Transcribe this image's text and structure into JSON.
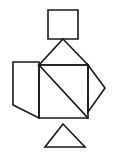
{
  "canvas": {
    "width": 123,
    "height": 153,
    "background_color": "#ffffff",
    "stroke_color": "#1a1a1a",
    "stroke_width": 1.6,
    "fill": "none"
  },
  "figure": {
    "description": "Line-drawing tangram silhouette resembling a bird or rooster, composed of seven outlined polygons: a small square head, a triangular neck, a large square body split by a diagonal, a right-pointing triangle beak-tail, a left parallelogram wing, and a triangular base stand.",
    "piece_count": 7
  },
  "shapes": [
    {
      "id": "head-square",
      "name": "head-square",
      "type": "polygon",
      "points": "48,10 78,10 78,39 48,39"
    },
    {
      "id": "neck-triangle",
      "name": "neck-triangle",
      "type": "polygon",
      "points": "63,39 88,65 39,65"
    },
    {
      "id": "body-square",
      "name": "body-square",
      "type": "polygon",
      "points": "39,65 88,65 88,118 39,118"
    },
    {
      "id": "body-diagonal",
      "name": "body-diagonal-line",
      "type": "line",
      "x1": 39,
      "y1": 65,
      "x2": 88,
      "y2": 118
    },
    {
      "id": "beak-triangle",
      "name": "right-pointing-triangle",
      "type": "polygon",
      "points": "88,65 105,88 88,112"
    },
    {
      "id": "wing-parallelogram",
      "name": "wing-parallelogram",
      "type": "polygon",
      "points": "13,62 39,62 39,118 13,105"
    },
    {
      "id": "base-triangle",
      "name": "base-triangle",
      "type": "polygon",
      "points": "63,124 85,147 45,147"
    }
  ],
  "colors": {
    "stroke": "#1a1a1a",
    "background": "#ffffff"
  }
}
